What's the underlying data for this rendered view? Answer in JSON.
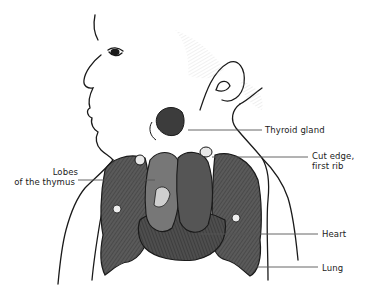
{
  "figure": {
    "labels": {
      "thyroid": "Thyroid gland",
      "cut_edge_line1": "Cut edge,",
      "cut_edge_line2": "first rib",
      "lobes_line1": "Lobes",
      "lobes_line2": "of the thymus",
      "heart": "Heart",
      "lung": "Lung"
    },
    "colors": {
      "ink": "#1a1a1a",
      "organ_dark": "#4a4a4a",
      "organ_mid": "#6a6a6a",
      "leader_line": "#555555",
      "background": "#ffffff"
    }
  }
}
